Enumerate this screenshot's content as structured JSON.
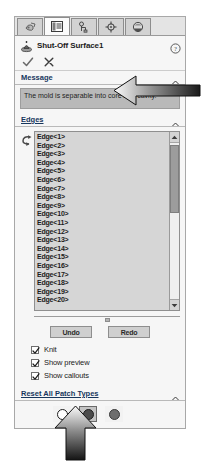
{
  "panel": {
    "tabs": [
      {
        "name": "tab-features",
        "icon": "features-icon",
        "active": false
      },
      {
        "name": "tab-property-manager",
        "icon": "list-icon",
        "active": true
      },
      {
        "name": "tab-configuration",
        "icon": "configuration-icon",
        "active": false
      },
      {
        "name": "tab-dimxpert",
        "icon": "dimxpert-icon",
        "active": false
      },
      {
        "name": "tab-appearances",
        "icon": "appearances-icon",
        "active": false
      }
    ],
    "title": "Shut-Off Surface1",
    "title_icon": "shut-off-surface-icon",
    "help_icon": "help-icon",
    "confirm": {
      "ok_icon": "checkmark-icon",
      "cancel_icon": "x-icon"
    }
  },
  "message_section": {
    "header": "Message",
    "collapse_icon": "chevron-up-icon",
    "text": "The mold is separable into core and cavity."
  },
  "edges_section": {
    "header": "Edges",
    "collapse_icon": "chevron-up-icon",
    "selection_icon": "edge-select-icon",
    "items": [
      "Edge<1>",
      "Edge<2>",
      "Edge<3>",
      "Edge<4>",
      "Edge<5>",
      "Edge<6>",
      "Edge<7>",
      "Edge<8>",
      "Edge<9>",
      "Edge<10>",
      "Edge<11>",
      "Edge<12>",
      "Edge<13>",
      "Edge<14>",
      "Edge<15>",
      "Edge<16>",
      "Edge<17>",
      "Edge<18>",
      "Edge<19>",
      "Edge<20>"
    ],
    "scroll_up_icon": "scroll-up-icon",
    "scroll_down_icon": "scroll-down-icon",
    "buttons": {
      "undo": "Undo",
      "redo": "Redo"
    },
    "options": [
      {
        "label": "Knit",
        "checked": true
      },
      {
        "label": "Show preview",
        "checked": true
      },
      {
        "label": "Show callouts",
        "checked": true
      }
    ]
  },
  "reset_section": {
    "header": "Reset All Patch Types",
    "collapse_icon": "chevron-up-icon",
    "patch_types": [
      {
        "name": "patch-type-no-fill",
        "style": "hollow",
        "selected": false
      },
      {
        "name": "patch-type-contact",
        "style": "dark",
        "selected": true
      },
      {
        "name": "patch-type-tangent",
        "style": "mid",
        "selected": false
      }
    ]
  },
  "annotations": [
    {
      "name": "callout-arrow-left",
      "direction": "left"
    },
    {
      "name": "callout-arrow-up",
      "direction": "up"
    }
  ]
}
